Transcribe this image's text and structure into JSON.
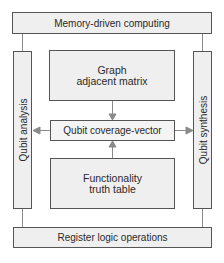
{
  "diagram": {
    "top_bar": {
      "label": "Memory-driven computing"
    },
    "bottom_bar": {
      "label": "Register logic operations"
    },
    "left_column": {
      "label": "Qubit analysis"
    },
    "right_column": {
      "label": "Qubit synthesis"
    },
    "center_top": {
      "line1": "Graph",
      "line2": "adjacent matrix"
    },
    "center_middle": {
      "label": "Qubit coverage-vector"
    },
    "center_bottom": {
      "line1": "Functionality",
      "line2": "truth table"
    },
    "edges": [
      {
        "from": "Graph adjacent matrix",
        "to": "Qubit coverage-vector",
        "type": "arrow"
      },
      {
        "from": "Functionality truth table",
        "to": "Qubit coverage-vector",
        "type": "arrow"
      },
      {
        "from": "Qubit coverage-vector",
        "to": "Qubit analysis",
        "type": "arrow"
      },
      {
        "from": "Qubit coverage-vector",
        "to": "Qubit synthesis",
        "type": "arrow"
      },
      {
        "from": "Memory-driven computing",
        "to": "Qubit analysis",
        "type": "line"
      },
      {
        "from": "Memory-driven computing",
        "to": "Qubit synthesis",
        "type": "line"
      },
      {
        "from": "Qubit analysis",
        "to": "Register logic operations",
        "type": "line"
      },
      {
        "from": "Qubit synthesis",
        "to": "Register logic operations",
        "type": "line"
      }
    ],
    "colors": {
      "box_fill": "#efefef",
      "border": "#555555",
      "connector": "#8a8a8a",
      "text": "#2a2a2a"
    }
  }
}
